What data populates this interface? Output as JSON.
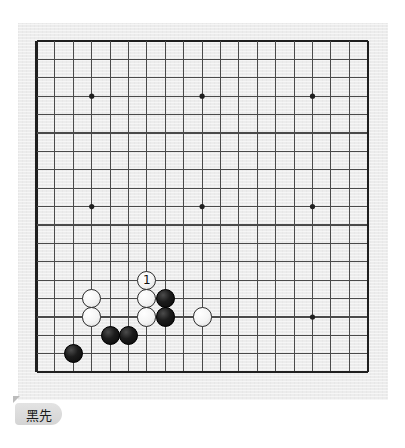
{
  "board": {
    "size": 19,
    "origin_x": 18.5,
    "origin_y": 18,
    "spacing": 18.4,
    "line_color": "#4a4a4a",
    "border_color": "#1f1f1f",
    "background_color": "#ececec",
    "star_points": [
      [
        3,
        3
      ],
      [
        9,
        3
      ],
      [
        15,
        3
      ],
      [
        3,
        9
      ],
      [
        9,
        9
      ],
      [
        15,
        9
      ],
      [
        3,
        15
      ],
      [
        9,
        15
      ],
      [
        15,
        15
      ]
    ],
    "stones": [
      {
        "color": "white",
        "col": 3,
        "row": 14,
        "label": ""
      },
      {
        "color": "white",
        "col": 3,
        "row": 15,
        "label": ""
      },
      {
        "color": "white",
        "col": 6,
        "row": 13,
        "label": "1"
      },
      {
        "color": "white",
        "col": 6,
        "row": 14,
        "label": ""
      },
      {
        "color": "white",
        "col": 6,
        "row": 15,
        "label": ""
      },
      {
        "color": "white",
        "col": 9,
        "row": 15,
        "label": ""
      },
      {
        "color": "black",
        "col": 7,
        "row": 14,
        "label": ""
      },
      {
        "color": "black",
        "col": 7,
        "row": 15,
        "label": ""
      },
      {
        "color": "black",
        "col": 4,
        "row": 16,
        "label": ""
      },
      {
        "color": "black",
        "col": 5,
        "row": 16,
        "label": ""
      },
      {
        "color": "black",
        "col": 2,
        "row": 17,
        "label": ""
      }
    ]
  },
  "caption": {
    "text": "黑先"
  }
}
